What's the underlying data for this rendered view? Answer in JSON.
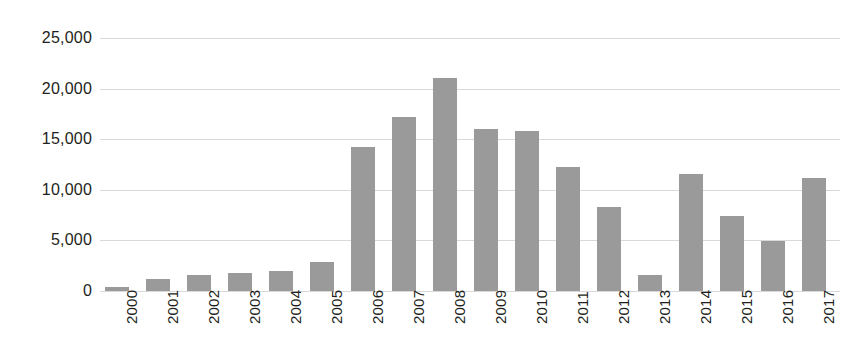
{
  "chart_data": {
    "type": "bar",
    "title": "",
    "subtitle": "",
    "xlabel": "",
    "ylabel": "",
    "categories": [
      "2000",
      "2001",
      "2002",
      "2003",
      "2004",
      "2005",
      "2006",
      "2007",
      "2008",
      "2009",
      "2010",
      "2011",
      "2012",
      "2013",
      "2014",
      "2015",
      "2016",
      "2017"
    ],
    "values": [
      400,
      1200,
      1550,
      1750,
      2000,
      2900,
      14200,
      17200,
      21000,
      16000,
      15800,
      12300,
      8300,
      1550,
      11600,
      7400,
      4900,
      11200
    ],
    "series": [
      {
        "name": "",
        "values": [
          400,
          1200,
          1550,
          1750,
          2000,
          2900,
          14200,
          17200,
          21000,
          16000,
          15800,
          12300,
          8300,
          1550,
          11600,
          7400,
          4900,
          11200
        ]
      }
    ],
    "ylim": [
      0,
      25000
    ],
    "y_ticks": [
      0,
      5000,
      10000,
      15000,
      20000,
      25000
    ],
    "y_tick_labels": [
      "0",
      "5,000",
      "10,000",
      "15,000",
      "20,000",
      "25,000"
    ],
    "grid": true,
    "grid_axis": "y",
    "legend": false,
    "legend_position": "none",
    "bar_color": "#9a9a9a",
    "gridline_color": "#d9d9d9",
    "background_color": "#ffffff",
    "text_color": "#231f20",
    "x_tick_rotation": 90,
    "annotations": []
  }
}
